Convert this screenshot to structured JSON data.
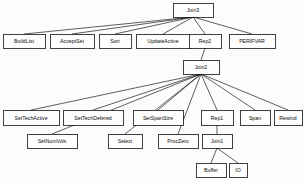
{
  "diagram": {
    "background_color": "#fdfdfd",
    "node_fill": "#ffffff",
    "node_stroke": "#101010",
    "edge_color": "#1a1a1a",
    "nodes": [
      {
        "id": "join3",
        "label": "Join3",
        "x": 173,
        "y": 3,
        "w": 40,
        "h": 14
      },
      {
        "id": "buildlist",
        "label": "BuildList",
        "x": 3,
        "y": 34,
        "w": 42,
        "h": 14
      },
      {
        "id": "acceptset",
        "label": "AcceptSet",
        "x": 50,
        "y": 34,
        "w": 44,
        "h": 14
      },
      {
        "id": "sort",
        "label": "Sort",
        "x": 99,
        "y": 34,
        "w": 32,
        "h": 14
      },
      {
        "id": "updateactive",
        "label": "UpdateActive",
        "x": 136,
        "y": 34,
        "w": 54,
        "h": 14
      },
      {
        "id": "rep2",
        "label": "Rep2",
        "x": 189,
        "y": 34,
        "w": 32,
        "h": 14
      },
      {
        "id": "perifvar",
        "label": "PERIFVAR",
        "x": 229,
        "y": 34,
        "w": 46,
        "h": 14
      },
      {
        "id": "join2",
        "label": "Join2",
        "x": 183,
        "y": 60,
        "w": 36,
        "h": 14
      },
      {
        "id": "settechactive",
        "label": "SetTechActive",
        "x": 3,
        "y": 110,
        "w": 56,
        "h": 15
      },
      {
        "id": "settechdefered",
        "label": "SetTechDefered",
        "x": 63,
        "y": 110,
        "w": 60,
        "h": 15
      },
      {
        "id": "setspansize",
        "label": "SetSpanSize",
        "x": 133,
        "y": 110,
        "w": 50,
        "h": 15
      },
      {
        "id": "rep1",
        "label": "Rep1",
        "x": 201,
        "y": 110,
        "w": 32,
        "h": 15
      },
      {
        "id": "span",
        "label": "Span",
        "x": 240,
        "y": 110,
        "w": 30,
        "h": 15
      },
      {
        "id": "rewind",
        "label": "Rewind",
        "x": 274,
        "y": 110,
        "w": 28,
        "h": 15
      },
      {
        "id": "setnumvols",
        "label": "SetNumVols",
        "x": 27,
        "y": 134,
        "w": 50,
        "h": 14
      },
      {
        "id": "select",
        "label": "Select",
        "x": 108,
        "y": 134,
        "w": 34,
        "h": 14
      },
      {
        "id": "proczero",
        "label": "ProcZero",
        "x": 158,
        "y": 134,
        "w": 40,
        "h": 14
      },
      {
        "id": "join1",
        "label": "Join1",
        "x": 202,
        "y": 134,
        "w": 30,
        "h": 14
      },
      {
        "id": "buffer",
        "label": "Buffer",
        "x": 196,
        "y": 163,
        "w": 30,
        "h": 14
      },
      {
        "id": "io",
        "label": "IO",
        "x": 229,
        "y": 163,
        "w": 18,
        "h": 14
      }
    ],
    "edges": [
      {
        "from": "join3",
        "to": "buildlist"
      },
      {
        "from": "join3",
        "to": "acceptset"
      },
      {
        "from": "join3",
        "to": "sort"
      },
      {
        "from": "join3",
        "to": "updateactive"
      },
      {
        "from": "join3",
        "to": "rep2"
      },
      {
        "from": "join3",
        "to": "perifvar"
      },
      {
        "from": "rep2",
        "to": "join2"
      },
      {
        "from": "join2",
        "to": "settechactive"
      },
      {
        "from": "join2",
        "to": "settechdefered"
      },
      {
        "from": "join2",
        "to": "setnumvols"
      },
      {
        "from": "join2",
        "to": "select"
      },
      {
        "from": "join2",
        "to": "setspansize"
      },
      {
        "from": "join2",
        "to": "proczero"
      },
      {
        "from": "join2",
        "to": "rep1"
      },
      {
        "from": "join2",
        "to": "span"
      },
      {
        "from": "join2",
        "to": "rewind"
      },
      {
        "from": "rep1",
        "to": "join1"
      },
      {
        "from": "join1",
        "to": "buffer"
      },
      {
        "from": "join1",
        "to": "io"
      }
    ]
  }
}
